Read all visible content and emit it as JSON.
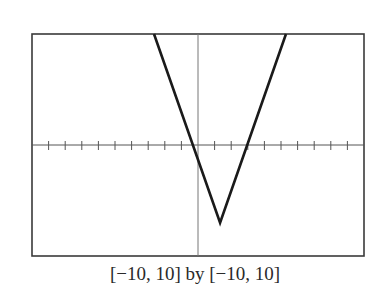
{
  "chart_data": {
    "type": "line",
    "title": "",
    "caption": "[−10, 10] by [−10, 10]",
    "xlabel": "",
    "ylabel": "",
    "xlim": [
      -10,
      10
    ],
    "ylim": [
      -10,
      10
    ],
    "x_tick_step": 1,
    "y_ticks_shown": false,
    "grid": false,
    "series": [
      {
        "name": "absolute value graph",
        "points": [
          [
            -2.65,
            10
          ],
          [
            1.33,
            -7
          ],
          [
            5.3,
            10
          ]
        ],
        "vertex": [
          1.33,
          -7
        ]
      }
    ]
  }
}
